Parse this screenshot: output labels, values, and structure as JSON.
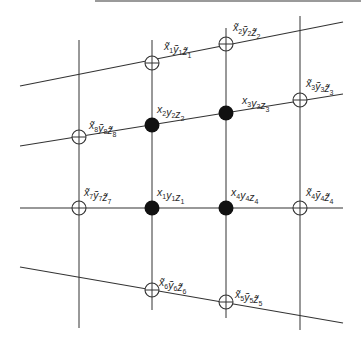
{
  "diagram": {
    "type": "grid-mesh-points",
    "colors": {
      "line": "#333333",
      "filled": "#111111",
      "open": "#333333",
      "background": "#ffffff"
    },
    "vertical_lines": [
      {
        "x": 79,
        "y1": 40,
        "y2": 328
      },
      {
        "x": 152,
        "y1": 40,
        "y2": 310
      },
      {
        "x": 226,
        "y1": 28,
        "y2": 318
      },
      {
        "x": 300,
        "y1": 16,
        "y2": 330
      }
    ],
    "skew_lines": [
      {
        "name": "top-line",
        "x1": 20,
        "y1": 86,
        "x2": 343,
        "y2": 22
      },
      {
        "name": "upper-line",
        "x1": 20,
        "y1": 146,
        "x2": 343,
        "y2": 94
      },
      {
        "name": "middle-line",
        "x1": 20,
        "y1": 208,
        "x2": 343,
        "y2": 208
      },
      {
        "name": "bottom-line",
        "x1": 20,
        "y1": 267,
        "x2": 343,
        "y2": 323
      }
    ],
    "filled_points": [
      {
        "id": "1",
        "label": "x",
        "sub": "1",
        "x": 152,
        "y": 208,
        "lx": 157,
        "ly": 196
      },
      {
        "id": "2",
        "label": "x",
        "sub": "2",
        "x": 152,
        "y": 125,
        "lx": 157,
        "ly": 113
      },
      {
        "id": "3",
        "label": "x",
        "sub": "3",
        "x": 226,
        "y": 113,
        "lx": 242,
        "ly": 104
      },
      {
        "id": "4",
        "label": "x",
        "sub": "4",
        "x": 226,
        "y": 208,
        "lx": 231,
        "ly": 196
      }
    ],
    "open_points": [
      {
        "id": "1",
        "sub": "1",
        "x": 152,
        "y": 63,
        "lx": 164,
        "ly": 50
      },
      {
        "id": "2",
        "sub": "2",
        "x": 226,
        "y": 44,
        "lx": 233,
        "ly": 31
      },
      {
        "id": "3",
        "sub": "3",
        "x": 300,
        "y": 100,
        "lx": 306,
        "ly": 87
      },
      {
        "id": "4",
        "sub": "4",
        "x": 300,
        "y": 208,
        "lx": 306,
        "ly": 196
      },
      {
        "id": "5",
        "sub": "5",
        "x": 226,
        "y": 302,
        "lx": 235,
        "ly": 298
      },
      {
        "id": "6",
        "sub": "6",
        "x": 152,
        "y": 290,
        "lx": 159,
        "ly": 286
      },
      {
        "id": "7",
        "sub": "7",
        "x": 79,
        "y": 208,
        "lx": 84,
        "ly": 196
      },
      {
        "id": "8",
        "sub": "8",
        "x": 79,
        "y": 137,
        "lx": 89,
        "ly": 129
      }
    ],
    "labels": {
      "filled_1": "x₁y₁z₁",
      "filled_2": "x₂y₂z₂",
      "filled_3": "x₃y₃z₃",
      "filled_4": "x₄y₄z₄",
      "open_1": "x̃₁ỹ₁z̃₁",
      "open_2": "x̃₂ỹ₂z̃₂",
      "open_3": "x̃₃ỹ₃z̃₃",
      "open_4": "x̃₄ỹ₄z̃₄",
      "open_5": "x̃₅ỹ₅z̃₅",
      "open_6": "x̃₆ỹ₆z̃₆",
      "open_7": "x̃₇ỹ₇z̃₇",
      "open_8": "x̃₈ỹ₈z̃₈"
    }
  }
}
